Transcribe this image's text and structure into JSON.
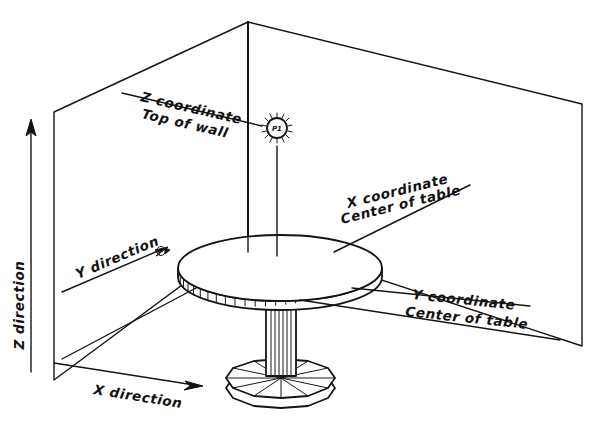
{
  "diagram": {
    "background_color": "#ffffff",
    "line_color": "#141414",
    "point_marker": {
      "name": "point-marker",
      "label": "P1"
    },
    "axes": [
      {
        "id": "z-axis",
        "label": "Z direction",
        "orientation": "vertical-up",
        "arrowhead": "solid"
      },
      {
        "id": "y-axis",
        "label": "Y direction",
        "orientation": "diagonal-up-right",
        "arrowhead": "open-small"
      },
      {
        "id": "x-axis",
        "label": "X direction",
        "orientation": "diagonal-down-right",
        "arrowhead": "solid"
      }
    ],
    "annotations": [
      {
        "id": "z-coordinate-annotation",
        "line1": "Z coordinate",
        "line2": "Top of wall",
        "leader": "to-top-of-back-wall"
      },
      {
        "id": "x-coordinate-annotation",
        "line1": "X coordinate",
        "line2": "Center of table",
        "leader": "to-table-top-edge"
      },
      {
        "id": "y-coordinate-annotation",
        "line1": "Y coordinate",
        "line2": "Center of table",
        "leader": "to-table-rim"
      }
    ],
    "objects": [
      {
        "id": "room-walls",
        "name": "two-wall-corner"
      },
      {
        "id": "table",
        "name": "round-pedestal-table"
      }
    ]
  }
}
